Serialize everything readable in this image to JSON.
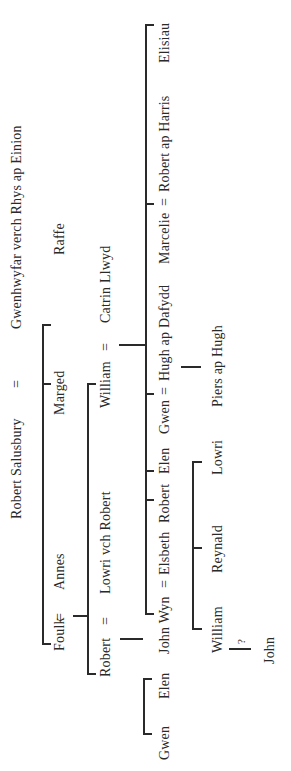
{
  "orientation": "rotated 90° counter-clockwise",
  "generations": {
    "gen1": {
      "husband": "Robert Salusbury",
      "eq": "=",
      "wife": "Gwenhwyfar verch Rhys ap Einion"
    },
    "gen2": {
      "foulk": "Foulk",
      "eq": "=",
      "annes": "Annes",
      "marged": "Marged",
      "raffe": "Raffe"
    },
    "gen3": {
      "robert": "Robert",
      "eq1": "=",
      "lowri": "Lowri vch Robert",
      "william": "William",
      "eq2": "=",
      "catrin": "Catrin Llwyd"
    },
    "gen4": {
      "gwen": "Gwen",
      "elen1": "Elen",
      "john_wyn": "John Wyn",
      "eq1": "=",
      "elsbeth": "Elsbeth",
      "robert": "Robert",
      "elen2": "Elen",
      "gwen2": "Gwen",
      "eq2": "=",
      "hugh": "Hugh ap Dafydd",
      "marcelie": "Marcelie",
      "eq3": "=",
      "robert_harris": "Robert ap Harris",
      "elisiau": "Elisiau"
    },
    "gen5": {
      "william": "William",
      "reynald": "Reynald",
      "lowri": "Lowri",
      "piers": "Piers ap Hugh"
    },
    "gen6": {
      "uncertain": "?",
      "john": "John"
    }
  },
  "colors": {
    "ink": "#2a2a2a",
    "background": "#ffffff"
  }
}
